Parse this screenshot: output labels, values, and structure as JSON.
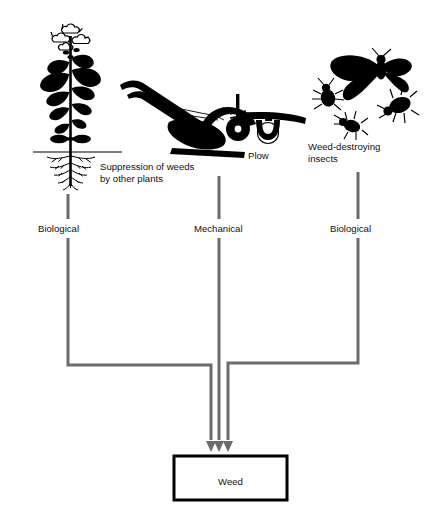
{
  "diagram": {
    "colors": {
      "connector": "#6b6b6b",
      "artwork": "#000000",
      "text": "#111111",
      "background": "#ffffff",
      "box_border": "#000000"
    },
    "branches": [
      {
        "id": "left",
        "icon_name": "flowering-weed-plant-with-roots-icon",
        "caption": "Suppression of weeds by other plants",
        "caption_line1": "Suppression of weeds",
        "caption_line2": "by other plants",
        "category": "Biological",
        "stem_x": 68
      },
      {
        "id": "center",
        "icon_name": "horse-drawn-plow-icon",
        "caption": "Plow",
        "caption_line1": "Plow",
        "caption_line2": "",
        "category": "Mechanical",
        "stem_x": 219
      },
      {
        "id": "right",
        "icon_name": "weed-destroying-insects-icon",
        "caption": "Weed-destroying insects",
        "caption_line1": "Weed-destroying",
        "caption_line2": "insects",
        "category": "Biological",
        "stem_x": 358
      }
    ],
    "target": {
      "label": "Weed",
      "arrow_count": 3
    }
  }
}
